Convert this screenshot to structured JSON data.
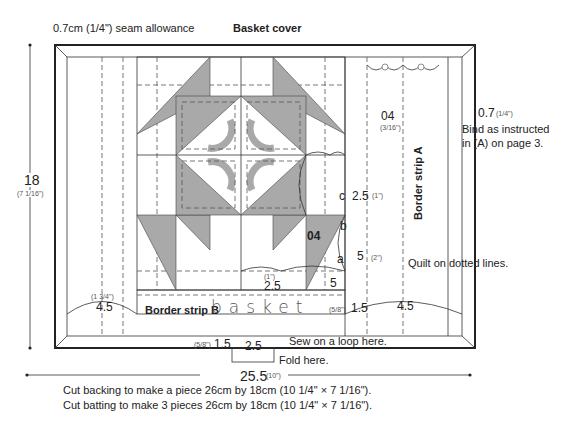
{
  "title": "Basket cover",
  "seam_allowance": "0.7cm (1/4\") seam allowance",
  "dimensions": {
    "height": "18",
    "height_in": "(7 1/16\")",
    "width": "25.5",
    "width_in": "(10\")",
    "binding": "0.7",
    "binding_in": "(1/4\")",
    "top_right_04": "04",
    "top_right_04_in": "(3/16\")",
    "c_dim": "2.5",
    "c_dim_in": "(1\")",
    "a_dim": "5",
    "a_dim_in": "(2\")",
    "center_04": "04",
    "bottom_25": "2.5",
    "bottom_25_in": "(1\")",
    "bottom_5": "5",
    "left_45": "4.5",
    "left_45_in": "(1 3/4\")",
    "right_15": "1.5",
    "right_15_in": "(5/8\")",
    "right_45": "4.5",
    "loop_15": "1.5",
    "loop_15_in": "(5/8\")",
    "loop_25": "2.5"
  },
  "piece_labels": {
    "a": "a",
    "b": "b",
    "c": "c"
  },
  "strips": {
    "a": "Border strip A",
    "b": "Border strip B"
  },
  "embroidery_text": "basket",
  "notes": {
    "bind": "Bind as instructed",
    "bind2": "in (A) on page 3.",
    "quilt": "Quilt on dotted lines.",
    "loop": "Sew on a loop here.",
    "fold": "Fold here.",
    "backing": "Cut backing to make a piece 26cm by 18cm (10 1/4\" × 7 1/16\").",
    "batting": "Cut batting to make 3 pieces 26cm by 18cm (10 1/4\" × 7 1/16\")."
  },
  "colors": {
    "gray": "#a9a9a9",
    "line": "#222222",
    "dash": "#555555"
  }
}
